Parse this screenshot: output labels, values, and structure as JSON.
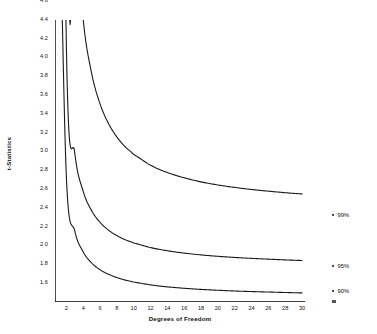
{
  "chart_data": {
    "type": "line",
    "title": "",
    "xlabel": "Degrees of Freedom",
    "ylabel": "t-Statistics",
    "xlim": [
      1,
      30
    ],
    "ylim": [
      1.6,
      4.6
    ],
    "grid": false,
    "legend_position": "right",
    "x_ticks": [
      2,
      4,
      6,
      8,
      10,
      12,
      14,
      16,
      18,
      20,
      22,
      24,
      26,
      28,
      30
    ],
    "y_ticks": [
      1.6,
      1.8,
      2.0,
      2.2,
      2.4,
      2.6,
      2.8,
      3.0,
      3.2,
      3.4,
      3.6,
      3.8,
      4.0,
      4.2,
      4.4,
      4.6
    ],
    "x": [
      1,
      2,
      3,
      4,
      5,
      6,
      7,
      8,
      9,
      10,
      12,
      14,
      16,
      18,
      20,
      22,
      24,
      26,
      28,
      30
    ],
    "series": [
      {
        "name": "99%",
        "values": [
          63.66,
          9.925,
          5.841,
          4.604,
          4.032,
          3.707,
          3.499,
          3.355,
          3.25,
          3.169,
          3.055,
          2.977,
          2.921,
          2.878,
          2.845,
          2.819,
          2.797,
          2.779,
          2.763,
          2.75
        ]
      },
      {
        "name": "95%",
        "values": [
          12.706,
          4.303,
          3.182,
          2.776,
          2.571,
          2.447,
          2.365,
          2.306,
          2.262,
          2.228,
          2.179,
          2.145,
          2.12,
          2.101,
          2.086,
          2.074,
          2.064,
          2.056,
          2.048,
          2.042
        ]
      },
      {
        "name": "90%",
        "values": [
          6.314,
          2.92,
          2.353,
          2.132,
          2.015,
          1.943,
          1.895,
          1.86,
          1.833,
          1.812,
          1.782,
          1.761,
          1.746,
          1.734,
          1.725,
          1.717,
          1.711,
          1.706,
          1.701,
          1.697
        ]
      }
    ],
    "legend": [
      {
        "label": "99%",
        "y_px": 212
      },
      {
        "label": "95%",
        "y_px": 263
      },
      {
        "label": "90%",
        "y_px": 288
      }
    ]
  }
}
